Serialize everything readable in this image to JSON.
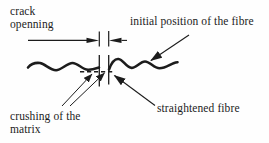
{
  "diagram": {
    "labels": {
      "crack_opening": "crack\nopenning",
      "initial_position": "initial position of the fibre",
      "crushing": "crushing of the\nmatrix",
      "straightened": "straightened fibre"
    },
    "colors": {
      "ink": "#1c1c1c",
      "background": "#fefefe"
    }
  }
}
